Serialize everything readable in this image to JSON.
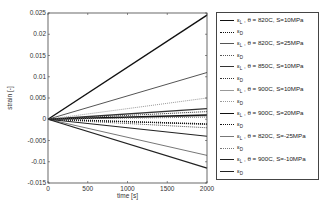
{
  "chart_data": {
    "type": "line",
    "title": "",
    "xlabel": "time [s]",
    "ylabel": "strain [-]",
    "xlim": [
      0,
      2000
    ],
    "ylim": [
      -0.015,
      0.025
    ],
    "xticks": [
      0,
      500,
      1000,
      1500,
      2000
    ],
    "yticks": [
      0.025,
      0.02,
      0.015,
      0.01,
      0.005,
      0,
      -0.005,
      -0.01,
      -0.015
    ],
    "xtick_labels": [
      "0",
      "500",
      "1000",
      "1500",
      "2000"
    ],
    "ytick_labels": [
      "0.025",
      "0.02",
      "0.015",
      "0.01",
      "0.005",
      "0",
      "-0.005",
      "-0.01",
      "-0.015"
    ],
    "grid": false,
    "legend_position": "outside-right",
    "series": [
      {
        "name": "εL , θ = 820C, S=10MPa",
        "style": "solid",
        "color": "#111111",
        "width": 1.4,
        "x": [
          0,
          2000
        ],
        "values": [
          0,
          0.0245
        ]
      },
      {
        "name": "εD",
        "style": "dotted",
        "color": "#111111",
        "width": 1.0,
        "x": [
          0,
          2000
        ],
        "values": [
          0,
          -0.0012
        ]
      },
      {
        "name": "εL , θ = 820C, S=25MPa",
        "style": "solid",
        "color": "#555555",
        "width": 1.0,
        "x": [
          0,
          2000
        ],
        "values": [
          0,
          0.011
        ]
      },
      {
        "name": "εD",
        "style": "dotted",
        "color": "#555555",
        "width": 1.0,
        "x": [
          0,
          2000
        ],
        "values": [
          0,
          -0.002
        ]
      },
      {
        "name": "εL , θ = 850C, S=10MPa",
        "style": "solid",
        "color": "#333333",
        "width": 1.4,
        "x": [
          0,
          2000
        ],
        "values": [
          0,
          0.0025
        ]
      },
      {
        "name": "εD",
        "style": "dotted",
        "color": "#333333",
        "width": 1.0,
        "x": [
          0,
          2000
        ],
        "values": [
          0,
          0.0018
        ]
      },
      {
        "name": "εL , θ = 900C, S=10MPa",
        "style": "solid",
        "color": "#999999",
        "width": 1.0,
        "x": [
          0,
          2000
        ],
        "values": [
          0,
          0.0008
        ]
      },
      {
        "name": "εD",
        "style": "dotted",
        "color": "#999999",
        "width": 1.0,
        "x": [
          0,
          2000
        ],
        "values": [
          0,
          0.005
        ]
      },
      {
        "name": "εL , θ = 900C, S=20MPa",
        "style": "solid",
        "color": "#111111",
        "width": 1.4,
        "x": [
          0,
          2000
        ],
        "values": [
          0,
          0.001
        ]
      },
      {
        "name": "εD",
        "style": "dotted",
        "color": "#111111",
        "width": 1.4,
        "x": [
          0,
          2000
        ],
        "values": [
          0,
          -0.0011
        ]
      },
      {
        "name": "εL , θ = 820C, S=-25MPa",
        "style": "solid",
        "color": "#777777",
        "width": 1.0,
        "x": [
          0,
          2000
        ],
        "values": [
          0,
          -0.0085
        ]
      },
      {
        "name": "εD",
        "style": "dotted",
        "color": "#777777",
        "width": 1.0,
        "x": [
          0,
          2000
        ],
        "values": [
          0,
          0.0005
        ]
      },
      {
        "name": "εL , θ = 900C, S=-10MPa",
        "style": "solid",
        "color": "#222222",
        "width": 1.2,
        "x": [
          0,
          2000
        ],
        "values": [
          0,
          -0.004
        ]
      },
      {
        "name": "εD",
        "style": "solid",
        "color": "#222222",
        "width": 1.2,
        "x": [
          0,
          2000
        ],
        "values": [
          0,
          -0.0115
        ]
      }
    ]
  },
  "axes": {
    "xlabel": "time [s]",
    "ylabel": "strain [-]"
  },
  "legend": {
    "items": [
      {
        "sym": "ε",
        "sub": "L",
        "rest": " , θ = 820C, S=10MPa"
      },
      {
        "sym": "ε",
        "sub": "D",
        "rest": ""
      },
      {
        "sym": "ε",
        "sub": "L",
        "rest": " , θ = 820C, S=25MPa"
      },
      {
        "sym": "ε",
        "sub": "D",
        "rest": ""
      },
      {
        "sym": "ε",
        "sub": "L",
        "rest": " , θ = 850C, S=10MPa"
      },
      {
        "sym": "ε",
        "sub": "D",
        "rest": ""
      },
      {
        "sym": "ε",
        "sub": "L",
        "rest": " , θ = 900C, S=10MPa"
      },
      {
        "sym": "ε",
        "sub": "D",
        "rest": ""
      },
      {
        "sym": "ε",
        "sub": "L",
        "rest": " , θ = 900C, S=20MPa"
      },
      {
        "sym": "ε",
        "sub": "D",
        "rest": ""
      },
      {
        "sym": "ε",
        "sub": "L",
        "rest": " , θ = 820C, S=-25MPa"
      },
      {
        "sym": "ε",
        "sub": "D",
        "rest": ""
      },
      {
        "sym": "ε",
        "sub": "L",
        "rest": " , θ = 900C, S=-10MPa"
      },
      {
        "sym": "ε",
        "sub": "D",
        "rest": ""
      }
    ]
  }
}
